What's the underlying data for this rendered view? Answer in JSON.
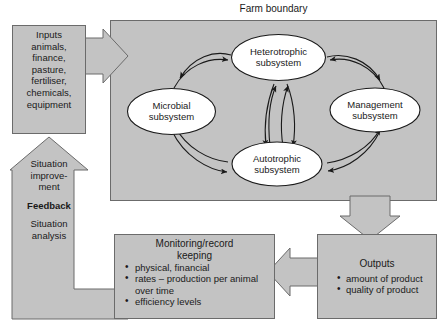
{
  "diagram": {
    "title": "Farm boundary",
    "farm_boundary_label": "Farm boundary",
    "inputs": {
      "heading": "Inputs",
      "items_text": "animals,\nfinance,\npasture,\nfertiliser,\nchemicals,\nequipment",
      "items": [
        "animals,",
        "finance,",
        "pasture,",
        "fertiliser,",
        "chemicals,",
        "equipment"
      ]
    },
    "subsystems": [
      {
        "id": "heterotrophic",
        "line1": "Heterotrophic",
        "line2": "subsystem"
      },
      {
        "id": "microbial",
        "line1": "Microbial",
        "line2": "subsystem"
      },
      {
        "id": "management",
        "line1": "Management",
        "line2": "subsystem"
      },
      {
        "id": "autotrophic",
        "line1": "Autotrophic",
        "line2": "subsystem"
      }
    ],
    "feedback": {
      "line1": "Situation",
      "line2": "improve-",
      "line3": "ment",
      "label": "Feedback",
      "line4": "Situation",
      "line5": "analysis"
    },
    "monitoring": {
      "title_line1": "Monitoring/record",
      "title_line2": "keeping",
      "items": [
        "physical, financial",
        "rates – production per animal over time",
        "efficiency levels"
      ]
    },
    "outputs": {
      "heading": "Outputs",
      "items": [
        "amount of product",
        "quality of product"
      ]
    },
    "colors": {
      "fill_gray": "#c3c3c3",
      "stroke": "#6b6b6b",
      "ellipse_fill": "#ffffff",
      "ellipse_stroke": "#1a1a1a",
      "text": "#1a1a1a",
      "page_background": "#ffffff"
    },
    "icons": {
      "input_arrow": "arrow-right-icon",
      "feedback_arrow": "arrow-up-icon",
      "output_arrow": "arrow-down-icon",
      "monitoring_arrow": "arrow-left-icon",
      "cycle_arrow": "curved-arrow-icon"
    }
  }
}
